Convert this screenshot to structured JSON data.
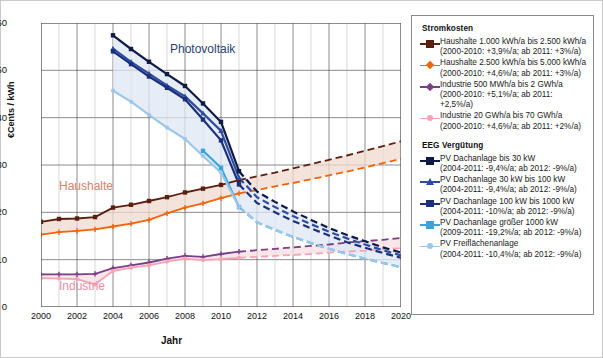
{
  "axes": {
    "ylabel": "€Cents / kWh",
    "xlabel": "Jahr",
    "yticks": [
      "0",
      "10",
      "20",
      "30",
      "40",
      "50",
      "60"
    ],
    "xticks": [
      "2000",
      "2002",
      "2004",
      "2006",
      "2008",
      "2010",
      "2012",
      "2014",
      "2016",
      "2018",
      "2020"
    ]
  },
  "annotations": {
    "photovoltaik": "Photovoltaik",
    "haushalte": "Haushalte",
    "industrie": "Industrie"
  },
  "legend": {
    "title_costs": "Stromkosten",
    "title_eeg": "EEG Vergütung",
    "cost_items": [
      {
        "label": "Haushalte 1.000 kWh/a bis 2.500 kWh/a",
        "sub": "(2000-2010: +3,9%/a; ab 2011: +3%/a)",
        "color": "#5b1f10",
        "marker": "square"
      },
      {
        "label": "Haushalte 2.500 kWh/a bis 5.000 kWh/a",
        "sub": "(2000-2010: +4,6%/a; ab 2011: +3%/a)",
        "color": "#f2640a",
        "marker": "plus"
      },
      {
        "label": "Industrie 500 MWh/a bis 2 GWh/a",
        "sub": "(2000-2010: +5,1%/a; ab 2011: +2,5%/a)",
        "color": "#7b3f86",
        "marker": "plus"
      },
      {
        "label": "Industrie 20 GWh/a bis 70 GWh/a",
        "sub": "(2000-2010: +4,6%/a; ab 2011: +2%/a)",
        "color": "#f5a3b5",
        "marker": "circle"
      }
    ],
    "eeg_items": [
      {
        "label": "PV Dachanlage bis 30 kW",
        "sub": "(2004-2011: -9,4%/a; ab 2012: -9%/a)",
        "color": "#101b45",
        "marker": "square"
      },
      {
        "label": "PV Dachanlage 30 kW bis 100 kW",
        "sub": "(2004-2011: -9,4%/a; ab 2012: -9%/a)",
        "color": "#2f4d9e",
        "marker": "triangle"
      },
      {
        "label": "PV Dachanlage 100 kW bis 1000 kW",
        "sub": "(2004-2011: -10%/a; ab 2012: -9%/a)",
        "color": "#1b2f7a",
        "marker": "square"
      },
      {
        "label": "PV Dachanlage größer 1000 kW",
        "sub": "(2009-2011: -19,2%/a; ab 2012: -9%/a)",
        "color": "#3aa5dd",
        "marker": "square"
      },
      {
        "label": "PV Freiflächenanlage",
        "sub": "(2004-2011: -10,4%/a; ab 2012: -9%/a)",
        "color": "#9cc8e8",
        "marker": "circle"
      }
    ]
  },
  "chart_data": {
    "type": "line",
    "title": "",
    "xlabel": "Jahr",
    "ylabel": "€Cents / kWh",
    "xlim": [
      2000,
      2020
    ],
    "ylim": [
      0,
      60
    ],
    "grid": true,
    "legend_position": "right",
    "series": [
      {
        "name": "Haushalte 1.000 kWh/a bis 2.500 kWh/a",
        "group": "Stromkosten",
        "color": "#5b1f10",
        "marker": "square",
        "solid_x": [
          2000,
          2001,
          2002,
          2003,
          2004,
          2005,
          2006,
          2007,
          2008,
          2009,
          2010,
          2011
        ],
        "solid_y": [
          18.0,
          18.6,
          18.7,
          19.0,
          21.0,
          21.6,
          22.4,
          23.2,
          24.2,
          25.0,
          25.8,
          26.8
        ],
        "dashed_x": [
          2011,
          2012,
          2013,
          2014,
          2015,
          2016,
          2017,
          2018,
          2019,
          2020
        ],
        "dashed_y": [
          26.8,
          27.6,
          28.4,
          29.3,
          30.2,
          31.1,
          32.0,
          33.0,
          34.0,
          35.0
        ]
      },
      {
        "name": "Haushalte 2.500 kWh/a bis 5.000 kWh/a",
        "group": "Stromkosten",
        "color": "#f2640a",
        "marker": "plus",
        "solid_x": [
          2000,
          2001,
          2002,
          2003,
          2004,
          2005,
          2006,
          2007,
          2008,
          2009,
          2010,
          2011
        ],
        "solid_y": [
          15.3,
          15.8,
          16.1,
          16.4,
          17.0,
          17.6,
          18.4,
          19.8,
          21.0,
          21.9,
          23.0,
          24.0
        ],
        "dashed_x": [
          2011,
          2012,
          2013,
          2014,
          2015,
          2016,
          2017,
          2018,
          2019,
          2020
        ],
        "dashed_y": [
          24.0,
          24.7,
          25.5,
          26.2,
          27.0,
          27.8,
          28.6,
          29.5,
          30.4,
          31.3
        ]
      },
      {
        "name": "Industrie 500 MWh/a bis 2 GWh/a",
        "group": "Stromkosten",
        "color": "#7b3f86",
        "marker": "plus",
        "solid_x": [
          2000,
          2001,
          2002,
          2003,
          2004,
          2005,
          2006,
          2007,
          2008,
          2009,
          2010,
          2011
        ],
        "solid_y": [
          6.9,
          6.9,
          6.9,
          7.0,
          8.2,
          8.8,
          9.4,
          10.2,
          10.8,
          10.6,
          11.2,
          11.7
        ],
        "dashed_x": [
          2011,
          2012,
          2013,
          2014,
          2015,
          2016,
          2017,
          2018,
          2019,
          2020
        ],
        "dashed_y": [
          11.7,
          12.0,
          12.3,
          12.6,
          12.9,
          13.2,
          13.6,
          13.9,
          14.2,
          14.6
        ]
      },
      {
        "name": "Industrie 20 GWh/a bis 70 GWh/a",
        "group": "Stromkosten",
        "color": "#f5a3b5",
        "marker": "circle",
        "solid_x": [
          2000,
          2001,
          2002,
          2003,
          2004,
          2005,
          2006,
          2007,
          2008,
          2009,
          2010,
          2011
        ],
        "solid_y": [
          6.1,
          6.0,
          5.9,
          4.8,
          7.6,
          8.3,
          8.8,
          9.6,
          10.2,
          9.9,
          10.1,
          10.4
        ],
        "dashed_x": [
          2011,
          2012,
          2013,
          2014,
          2015,
          2016,
          2017,
          2018,
          2019,
          2020
        ],
        "dashed_y": [
          10.4,
          10.6,
          10.8,
          11.0,
          11.2,
          11.5,
          11.7,
          11.9,
          12.2,
          12.4
        ]
      },
      {
        "name": "PV Dachanlage bis 30 kW",
        "group": "EEG Vergütung",
        "color": "#101b45",
        "marker": "square",
        "solid_x": [
          2004,
          2005,
          2006,
          2007,
          2008,
          2009,
          2010,
          2011
        ],
        "solid_y": [
          57.4,
          54.5,
          51.8,
          49.2,
          46.7,
          43.0,
          39.1,
          28.7
        ],
        "dashed_x": [
          2011,
          2012,
          2013,
          2014,
          2015,
          2016,
          2017,
          2018,
          2019,
          2020
        ],
        "dashed_y": [
          28.7,
          24.4,
          22.2,
          20.2,
          18.4,
          16.7,
          15.2,
          13.9,
          12.6,
          11.5
        ]
      },
      {
        "name": "PV Dachanlage 30 kW bis 100 kW",
        "group": "EEG Vergütung",
        "color": "#2f4d9e",
        "marker": "triangle",
        "solid_x": [
          2004,
          2005,
          2006,
          2007,
          2008,
          2009,
          2010,
          2011
        ],
        "solid_y": [
          54.6,
          51.8,
          49.3,
          46.8,
          44.5,
          40.9,
          37.2,
          27.3
        ],
        "dashed_x": [
          2011,
          2012,
          2013,
          2014,
          2015,
          2016,
          2017,
          2018,
          2019,
          2020
        ],
        "dashed_y": [
          27.3,
          23.2,
          21.1,
          19.2,
          17.5,
          15.9,
          14.5,
          13.2,
          12.0,
          10.9
        ]
      },
      {
        "name": "PV Dachanlage 100 kW bis 1000 kW",
        "group": "EEG Vergütung",
        "color": "#1b2f7a",
        "marker": "square",
        "solid_x": [
          2004,
          2005,
          2006,
          2007,
          2008,
          2009,
          2010,
          2011
        ],
        "solid_y": [
          54.0,
          51.3,
          48.7,
          46.3,
          43.9,
          39.6,
          35.2,
          25.9
        ],
        "dashed_x": [
          2011,
          2012,
          2013,
          2014,
          2015,
          2016,
          2017,
          2018,
          2019,
          2020
        ],
        "dashed_y": [
          25.9,
          22.0,
          20.0,
          18.2,
          16.6,
          15.1,
          13.7,
          12.5,
          11.4,
          10.4
        ]
      },
      {
        "name": "PV Dachanlage größer 1000 kW",
        "group": "EEG Vergütung",
        "color": "#3aa5dd",
        "marker": "square",
        "solid_x": [
          2009,
          2010,
          2011
        ],
        "solid_y": [
          33.0,
          29.4,
          21.1
        ],
        "dashed_x": [
          2011,
          2012,
          2013,
          2014,
          2015,
          2016,
          2017,
          2018,
          2019,
          2020
        ],
        "dashed_y": [
          21.1,
          17.9,
          16.3,
          14.8,
          13.5,
          12.3,
          11.2,
          10.2,
          9.3,
          8.4
        ]
      },
      {
        "name": "PV Freiflächenanlage",
        "group": "EEG Vergütung",
        "color": "#9cc8e8",
        "marker": "circle",
        "solid_x": [
          2004,
          2005,
          2006,
          2007,
          2008,
          2009,
          2010,
          2011
        ],
        "solid_y": [
          45.7,
          43.4,
          40.6,
          37.9,
          35.5,
          31.9,
          28.4,
          21.1
        ],
        "dashed_x": [
          2011,
          2012,
          2013,
          2014,
          2015,
          2016,
          2017,
          2018,
          2019,
          2020
        ],
        "dashed_y": [
          21.1,
          17.9,
          16.3,
          14.8,
          13.5,
          12.3,
          11.2,
          10.2,
          9.3,
          8.4
        ]
      }
    ]
  }
}
